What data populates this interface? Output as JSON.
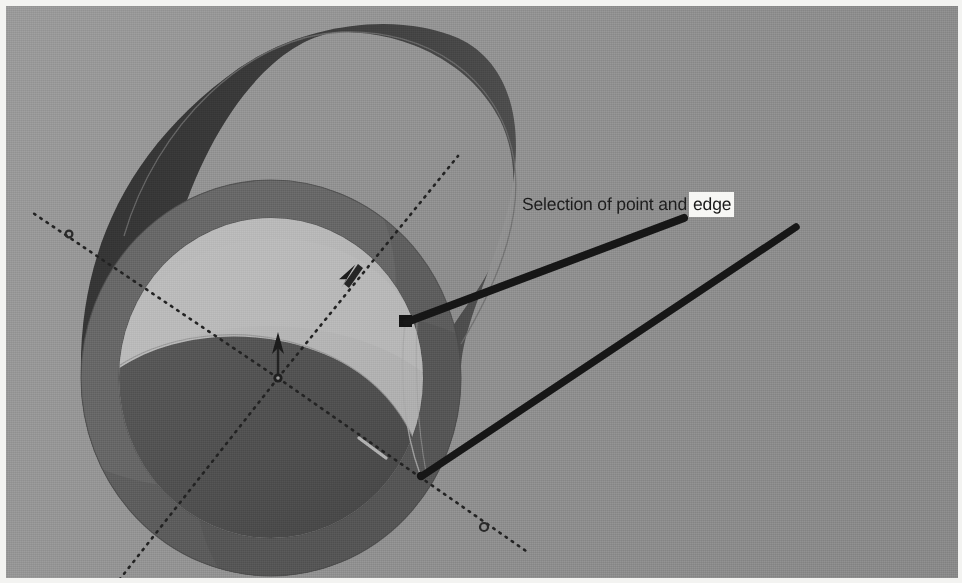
{
  "canvas": {
    "width": 962,
    "height": 583,
    "background_top_left": "#9a9a9a",
    "background_bottom_right": "#898989",
    "page_margin_color": "#f3f3f1"
  },
  "annotation": {
    "label_prefix": "Selection of point and",
    "label_highlighted": "edge",
    "full_text": "Selection of point and edge",
    "text_color": "#1d1d1d",
    "highlight_background": "#f7f7f5",
    "leader_color": "#1a1a1a",
    "leaders": [
      {
        "name": "leader-to-point",
        "from_x": 678,
        "from_y": 212,
        "to_x": 400,
        "to_y": 316,
        "target": "point"
      },
      {
        "name": "leader-to-edge",
        "from_x": 790,
        "from_y": 221,
        "to_x": 417,
        "to_y": 470,
        "target": "edge"
      }
    ]
  },
  "model": {
    "name": "cylinder-with-bore",
    "surface_dark": "#3a3a3a",
    "surface_mid": "#6a6a6a",
    "surface_rim": "#5e5e5e",
    "surface_light": "#b4b4b4",
    "surface_inner_shadow": "#4a4a4a",
    "outline_color": "#555555",
    "front_face": {
      "cx": 265,
      "cy": 372,
      "outer_rx": 190,
      "outer_ry": 198,
      "inner_rx": 152,
      "inner_ry": 160
    },
    "back_face": {
      "cx": 330,
      "cy": 170,
      "rx": 182,
      "ry": 145
    }
  },
  "axes": {
    "name": "triad-axes",
    "origin_x": 272,
    "origin_y": 372,
    "line_style": "dotted",
    "line_color": "#262626",
    "endpoints": [
      {
        "name": "axis-upper-right",
        "x": 452,
        "y": 150,
        "marker": "arrow"
      },
      {
        "name": "axis-upper-left",
        "x": 24,
        "y": 205,
        "marker": "circle"
      },
      {
        "name": "axis-lower-right",
        "x": 520,
        "y": 545,
        "marker": "circle"
      },
      {
        "name": "axis-lower-left",
        "x": 110,
        "y": 583,
        "marker": "none"
      },
      {
        "name": "axis-vertical-up",
        "x": 272,
        "y": 330,
        "marker": "arrow"
      }
    ]
  },
  "markers": {
    "selected_point": {
      "name": "selected-point",
      "x": 399,
      "y": 315,
      "shape": "square",
      "color": "#1a1a1a"
    },
    "selected_edge_end": {
      "name": "selected-edge-endpoint",
      "x": 416,
      "y": 470,
      "shape": "dot",
      "color": "#1a1a1a"
    },
    "origin_marker": {
      "name": "origin-marker",
      "x": 272,
      "y": 372,
      "shape": "circle",
      "color": "#1f1f1f"
    }
  }
}
